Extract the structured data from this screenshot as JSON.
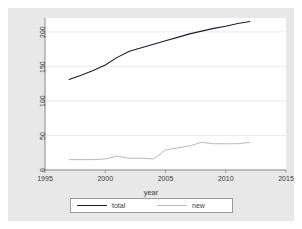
{
  "chart_data": {
    "type": "line",
    "title": "",
    "xlabel": "year",
    "ylabel": "",
    "xlim": [
      1995,
      2015
    ],
    "ylim": [
      0,
      220
    ],
    "xticks": [
      1995,
      2000,
      2005,
      2010,
      2015
    ],
    "yticks": [
      0,
      50,
      100,
      150,
      200
    ],
    "grid": "horizontal",
    "legend_position": "bottom",
    "x": [
      1997,
      1998,
      1999,
      2000,
      2001,
      2002,
      2003,
      2004,
      2005,
      2006,
      2007,
      2008,
      2009,
      2010,
      2011,
      2012
    ],
    "series": [
      {
        "name": "total",
        "color": "#1a1a3c",
        "values": [
          131,
          137,
          144,
          152,
          163,
          172,
          177,
          182,
          187,
          192,
          197,
          201,
          205,
          208,
          212,
          215
        ]
      },
      {
        "name": "new",
        "color": "#b9b9b9",
        "values": [
          15,
          15,
          15,
          16,
          20,
          17,
          17,
          16,
          29,
          32,
          35,
          40,
          38,
          38,
          38,
          40
        ]
      }
    ]
  },
  "axes": {
    "y_tick_labels": [
      "0",
      "50",
      "100",
      "150",
      "200"
    ],
    "x_tick_labels": [
      "1995",
      "2000",
      "2005",
      "2010",
      "2015"
    ],
    "x_axis_title": "year"
  },
  "legend": {
    "entries": [
      {
        "label": "total",
        "color": "#1a1a3c"
      },
      {
        "label": "new",
        "color": "#b9b9b9"
      }
    ]
  },
  "colors": {
    "figure_background": "#e8e8e8",
    "plot_background": "#ffffff",
    "grid": "#e2e2ea",
    "axis": "#8a8a8a",
    "text": "#3c3c3c"
  }
}
